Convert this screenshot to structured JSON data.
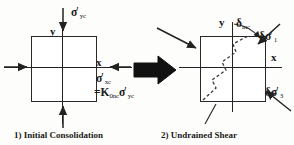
{
  "figure": {
    "type": "geotechnical-stress-diagram",
    "colors": {
      "ink": "#1a1a1a",
      "line": "#222222",
      "fill": "#ffffff",
      "hatch": "#4a4a4a"
    }
  },
  "left_panel": {
    "caption": "1) Initial Consolidation",
    "axis_y_label": "y",
    "axis_x_label": "x",
    "vertical_stress": {
      "sigma": "σ",
      "prime": "′",
      "sub": "yc"
    },
    "horizontal_stress": {
      "sigma": "σ",
      "prime": "′",
      "sub": "xc"
    },
    "k0_relation": {
      "equals": "=K",
      "k_sub": "0nc",
      "sigma": "σ",
      "prime": "′",
      "sigma_sub": "yc"
    },
    "arrows": [
      "top-down-vertical",
      "bottom-up-vertical",
      "left-to-right-horizontal",
      "right-to-left-horizontal"
    ]
  },
  "transition": {
    "arrow": "thick-right-arrow"
  },
  "right_panel": {
    "caption": "2) Undrained Shear",
    "axis_y_label": "y",
    "axis_x_label": "x",
    "increment_label": {
      "delta": "δ",
      "sub": "inc"
    },
    "major_stress_increment": {
      "delta": "δ",
      "sigma": "σ",
      "prime": "′",
      "sub": "1"
    },
    "minor_stress_increment": {
      "delta": "δ",
      "sigma": "σ",
      "prime": "′",
      "sub": "3"
    },
    "shear_band": "dashed-diagonal-shear-line",
    "arrows": [
      "upper-left-inclined",
      "upper-right-inclined",
      "lower-right-inclined",
      "leader-to-caption"
    ]
  }
}
